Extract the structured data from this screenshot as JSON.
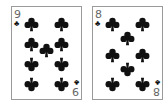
{
  "cards": [
    {
      "rank": "9",
      "suit": "clubs",
      "suit_symbol": "♣",
      "color": "#111111",
      "pips": [
        {
          "x": 19,
          "y": 17,
          "inv": false
        },
        {
          "x": 49,
          "y": 17,
          "inv": false
        },
        {
          "x": 19,
          "y": 37,
          "inv": false
        },
        {
          "x": 49,
          "y": 37,
          "inv": false
        },
        {
          "x": 34,
          "y": 43,
          "inv": false
        },
        {
          "x": 19,
          "y": 57,
          "inv": true
        },
        {
          "x": 49,
          "y": 57,
          "inv": true
        },
        {
          "x": 19,
          "y": 77,
          "inv": true
        },
        {
          "x": 49,
          "y": 77,
          "inv": true
        }
      ]
    },
    {
      "rank": "8",
      "suit": "clubs",
      "suit_symbol": "♣",
      "color": "#111111",
      "pips": [
        {
          "x": 19,
          "y": 17,
          "inv": false
        },
        {
          "x": 49,
          "y": 17,
          "inv": false
        },
        {
          "x": 34,
          "y": 31,
          "inv": false
        },
        {
          "x": 19,
          "y": 48,
          "inv": false
        },
        {
          "x": 49,
          "y": 48,
          "inv": false
        },
        {
          "x": 34,
          "y": 62,
          "inv": true
        },
        {
          "x": 19,
          "y": 77,
          "inv": true
        },
        {
          "x": 49,
          "y": 77,
          "inv": true
        }
      ]
    }
  ]
}
